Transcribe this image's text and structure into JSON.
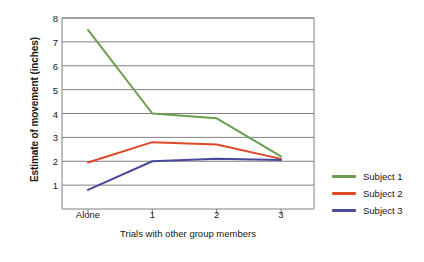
{
  "chart_data": {
    "type": "line",
    "title": "",
    "xlabel": "Trials with other group members",
    "ylabel": "Estimate of movement (inches)",
    "categories": [
      "Alone",
      "1",
      "2",
      "3"
    ],
    "x_tick_labels": [
      "Alone",
      "1",
      "2",
      "3"
    ],
    "y_tick_labels": [
      "1",
      "2",
      "3",
      "4",
      "5",
      "6",
      "7",
      "8"
    ],
    "ylim": [
      0,
      8
    ],
    "grid": "horizontal",
    "legend_position": "right",
    "series": [
      {
        "name": "Subject 1",
        "color": "#6a9e4c",
        "values": [
          7.5,
          4.0,
          3.8,
          2.2
        ]
      },
      {
        "name": "Subject 2",
        "color": "#e0482a",
        "values": [
          1.95,
          2.8,
          2.7,
          2.1
        ]
      },
      {
        "name": "Subject 3",
        "color": "#4a4a9c",
        "values": [
          0.8,
          2.0,
          2.1,
          2.05
        ]
      }
    ]
  }
}
